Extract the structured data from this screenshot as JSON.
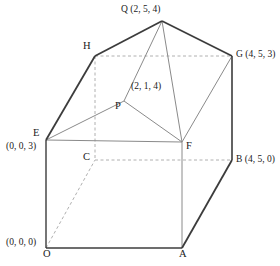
{
  "figure": {
    "stroke_color_solid": "#3c3c3c",
    "stroke_color_thin": "#8a8a8a",
    "stroke_color_dashed": "#b0b0b0",
    "background_color": "#ffffff"
  },
  "labels": {
    "Q": {
      "vertex": "Q",
      "coords": "(2, 5, 4)",
      "combined": "Q (2, 5, 4)"
    },
    "H": {
      "vertex": "H",
      "coords": "",
      "combined": "H"
    },
    "G": {
      "vertex": "G",
      "coords": "(4, 5, 3)",
      "combined": "G (4, 5, 3)"
    },
    "P": {
      "vertex": "P",
      "coords": "(2, 1, 4)",
      "combined": "P"
    },
    "P_coords": {
      "vertex": "",
      "coords": "(2, 1, 4)",
      "combined": "(2, 1, 4)"
    },
    "E": {
      "vertex": "E",
      "coords": "(0, 0, 3)",
      "combined": "E"
    },
    "E_coords": {
      "vertex": "",
      "coords": "(0, 0, 3)",
      "combined": "(0, 0, 3)"
    },
    "C": {
      "vertex": "C",
      "coords": "",
      "combined": "C"
    },
    "F": {
      "vertex": "F",
      "coords": "",
      "combined": "F"
    },
    "B": {
      "vertex": "B",
      "coords": "(4, 5, 0)",
      "combined": "B (4, 5, 0)"
    },
    "O": {
      "vertex": "O",
      "coords": "(0, 0, 0)",
      "combined": "O"
    },
    "O_coords": {
      "vertex": "",
      "coords": "(0, 0, 0)",
      "combined": "(0, 0, 0)"
    },
    "A": {
      "vertex": "A",
      "coords": "",
      "combined": "A"
    }
  },
  "geometry": {
    "points": {
      "O": [
        46,
        248
      ],
      "A": [
        182,
        248
      ],
      "B": [
        232,
        160
      ],
      "C": [
        95,
        160
      ],
      "E": [
        46,
        140
      ],
      "F": [
        182,
        142
      ],
      "G": [
        232,
        56
      ],
      "H": [
        95,
        56
      ],
      "P": [
        124,
        101
      ],
      "Q": [
        162,
        21
      ]
    },
    "solid_edges": [
      [
        "O",
        "A"
      ],
      [
        "O",
        "E"
      ],
      [
        "E",
        "H"
      ],
      [
        "H",
        "Q"
      ],
      [
        "Q",
        "G"
      ],
      [
        "G",
        "B"
      ],
      [
        "B",
        "A"
      ]
    ],
    "thin_edges": [
      [
        "E",
        "F"
      ],
      [
        "A",
        "F"
      ],
      [
        "E",
        "P"
      ],
      [
        "P",
        "Q"
      ],
      [
        "P",
        "F"
      ],
      [
        "F",
        "G"
      ],
      [
        "Q",
        "F"
      ]
    ],
    "dashed_edges": [
      [
        "H",
        "G"
      ],
      [
        "C",
        "B"
      ],
      [
        "H",
        "C"
      ],
      [
        "O",
        "C"
      ]
    ]
  }
}
